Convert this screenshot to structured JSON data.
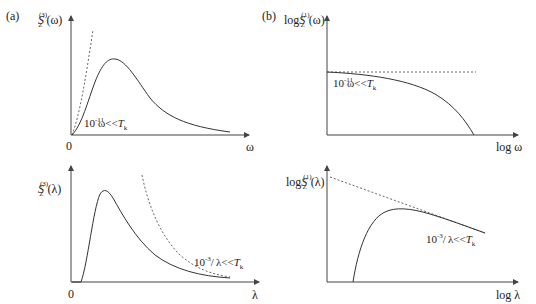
{
  "figure": {
    "panels": [
      {
        "id": "a",
        "tag": "(a)",
        "ylabel": {
          "base": "S",
          "sup": "(3)",
          "sub": "Z",
          "arg": "(ω)"
        },
        "xlabel": "ω",
        "origin": "0",
        "annotation": {
          "prefix": "10",
          "sup": "-11",
          "rest": "ω<<",
          "T": "T",
          "Tsub": "k"
        }
      },
      {
        "id": "b",
        "tag": "(b)",
        "ylabel": {
          "pre": "log",
          "base": "S",
          "sup": "(1)",
          "sub": "Z",
          "arg": "(ω)"
        },
        "xlabel": "log ω",
        "annotation": {
          "prefix": "10",
          "sup": "-11",
          "rest": "ω<<",
          "T": "T",
          "Tsub": "k"
        }
      },
      {
        "id": "c",
        "ylabel": {
          "base": "S",
          "sup": "(3)",
          "sub": "Z",
          "arg": "(λ)"
        },
        "xlabel": "λ",
        "origin": "0",
        "annotation": {
          "prefix": "10",
          "sup": "-3",
          "rest": "λ<<",
          "T": "T",
          "Tsub": "k"
        }
      },
      {
        "id": "d",
        "ylabel": {
          "pre": "log",
          "base": "S",
          "sup": "(1)",
          "sub": "Z",
          "arg": "(λ)"
        },
        "xlabel": "log λ",
        "annotation": {
          "prefix": "10",
          "sup": "-3",
          "rest": "λ<<",
          "T": "T",
          "Tsub": "k"
        }
      }
    ],
    "colors": {
      "line": "#333333",
      "dash": "#555555",
      "axis": "#444444"
    }
  }
}
